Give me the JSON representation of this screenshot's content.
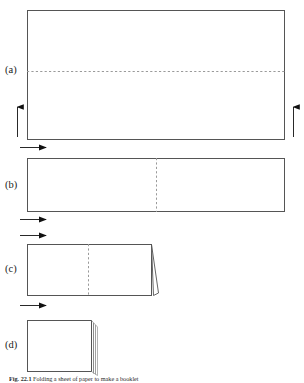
{
  "figure": {
    "caption_prefix": "Fig. 22.1",
    "caption_text": "Folding a sheet of paper to make a booklet",
    "background_color": "#ffffff",
    "line_color": "#555555",
    "dash_color": "#9a9a9a",
    "arrow_color": "#111111",
    "width": 304,
    "height": 383
  },
  "panels": [
    {
      "id": "a",
      "label": "(a)",
      "label_x": 5,
      "label_y": 65,
      "description": "full open sheet with horizontal fold line",
      "rect": {
        "x": 27,
        "y": 10,
        "w": 258,
        "h": 130
      },
      "fold_line": {
        "type": "horizontal-dashed",
        "y": 71,
        "x1": 27,
        "x2": 285
      },
      "arrows": [
        {
          "name": "fold-up-arrow-left",
          "type": "up",
          "x": 17,
          "y_top": 105,
          "y_bottom": 137
        },
        {
          "name": "fold-up-arrow-right",
          "type": "up",
          "x": 293,
          "y_top": 105,
          "y_bottom": 137
        }
      ]
    },
    {
      "id": "b",
      "label": "(b)",
      "label_x": 5,
      "label_y": 180,
      "description": "sheet folded once, vertical fold line at centre",
      "rect": {
        "x": 27,
        "y": 158,
        "w": 258,
        "h": 54
      },
      "fold_line": {
        "type": "vertical-dashed",
        "x": 156,
        "y1": 158,
        "y2": 212
      },
      "arrows": [
        {
          "name": "fold-right-arrow-top",
          "type": "right",
          "x1": 20,
          "x2": 48,
          "y": 147
        },
        {
          "name": "fold-right-arrow-bottom",
          "type": "right",
          "x1": 20,
          "x2": 48,
          "y": 219
        }
      ]
    },
    {
      "id": "c",
      "label": "(c)",
      "label_x": 5,
      "label_y": 264,
      "description": "sheet folded twice with open flap at right edge",
      "rect": {
        "x": 27,
        "y": 244,
        "w": 125,
        "h": 52
      },
      "fold_line": {
        "type": "vertical-dashed",
        "x": 88,
        "y1": 244,
        "y2": 296
      },
      "flap": {
        "x_base": 152,
        "x_tip": 159,
        "y_top": 244,
        "y_bottom": 296
      },
      "arrows": [
        {
          "name": "fold-right-arrow-top",
          "type": "right",
          "x1": 20,
          "x2": 48,
          "y": 235
        },
        {
          "name": "fold-right-arrow-bottom",
          "type": "right",
          "x1": 20,
          "x2": 48,
          "y": 305
        }
      ]
    },
    {
      "id": "d",
      "label": "(d)",
      "label_x": 5,
      "label_y": 340,
      "description": "finished folded booklet showing stacked page edges",
      "rect": {
        "x": 27,
        "y": 320,
        "w": 65,
        "h": 52
      },
      "layers": [
        {
          "x": 94,
          "y_top": 323,
          "y_bottom": 374
        },
        {
          "x": 96,
          "y_top": 325,
          "y_bottom": 375
        },
        {
          "x": 98,
          "y_top": 327,
          "y_bottom": 376
        }
      ]
    }
  ]
}
